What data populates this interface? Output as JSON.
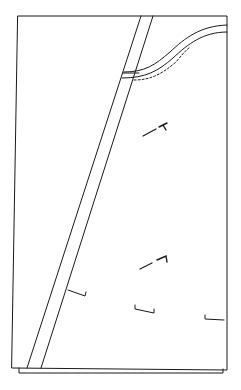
{
  "diagram": {
    "type": "patent-line-drawing",
    "background": "#ffffff",
    "stroke": "#1a1a1a",
    "elements": [
      {
        "name": "outer-panel",
        "kind": "rectangle"
      },
      {
        "name": "diagonal-strip",
        "kind": "parallel-lines"
      },
      {
        "name": "curved-strip",
        "kind": "curved-parallel-lines"
      },
      {
        "name": "dashed-stitch-line",
        "kind": "dashed-curve"
      },
      {
        "name": "tack-marks",
        "kind": "short-marks",
        "count": 2
      },
      {
        "name": "bracket-marks",
        "kind": "brackets",
        "count": 3
      }
    ]
  }
}
